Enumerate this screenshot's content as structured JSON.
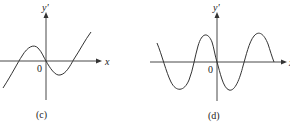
{
  "panels": [
    {
      "id": "c",
      "caption": "(c)",
      "y_axis_label": "y'",
      "x_axis_label": "x",
      "origin_label": "0",
      "curve": "cubic-like: rises from lower-left, local max left of origin, crosses 0 at origin going down, local min right of origin, rises to upper-right"
    },
    {
      "id": "d",
      "caption": "(d)",
      "y_axis_label": "y'",
      "x_axis_label": "x",
      "origin_label": "0",
      "curve": "sinusoid-like: starts high at left, trough, peak left of origin, passes through origin decreasing, trough, peak, ends at x-axis"
    }
  ],
  "colors": {
    "stroke": "#333333",
    "text": "#222222"
  }
}
